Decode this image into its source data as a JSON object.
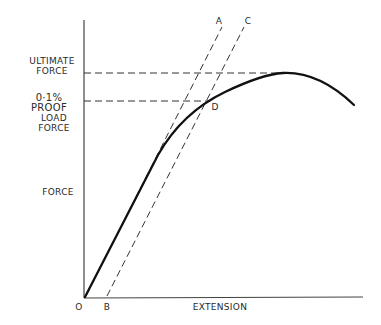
{
  "diagram": {
    "type": "force-extension curve",
    "axes": {
      "x_label": "EXTENSION",
      "y_label": "FORCE",
      "origin_label": "O"
    },
    "points": {
      "A": "A",
      "B": "B",
      "C": "C",
      "D": "D"
    },
    "y_annotations": {
      "ultimate_line1": "ULTIMATE",
      "ultimate_line2": "FORCE",
      "proof_line1": "0·1% PROOF",
      "proof_line2": "LOAD",
      "proof_line3": "FORCE"
    },
    "colors": {
      "curve": "#111111",
      "axes": "#333333",
      "dashed": "#333333"
    }
  }
}
